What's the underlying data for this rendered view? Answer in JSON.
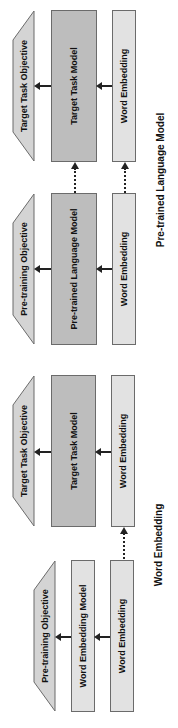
{
  "diagram": {
    "groups": [
      {
        "caption": "Pre-trained Language Model",
        "panels": [
          {
            "objective": "Target Task Objective",
            "model": "Target Task Model",
            "embedding": "Word Embedding"
          },
          {
            "objective": "Pre-training Objective",
            "model": "Pre-trained Language Model",
            "embedding": "Word Embedding"
          }
        ]
      },
      {
        "caption": "Word Embedding",
        "panels": [
          {
            "objective": "Target Task Objective",
            "model": "Target Task Model",
            "embedding": "Word Embedding"
          },
          {
            "objective": "Pre-training Objective",
            "model": "Word Embedding Model",
            "embedding": "Word Embedding"
          }
        ]
      }
    ],
    "colors": {
      "model_fill": "#bdbdbd",
      "embedding_fill": "#e2e2e2",
      "objective_fill": "#d4d4d4",
      "stroke": "#6b6b6b"
    }
  }
}
